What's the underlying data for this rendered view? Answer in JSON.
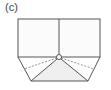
{
  "figure": {
    "label": "(c)",
    "colors": {
      "line": "#555555",
      "fill_shaded": "#eeeeee",
      "background": "#ffffff"
    }
  }
}
